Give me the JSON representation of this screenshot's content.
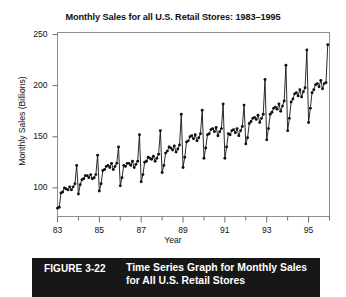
{
  "figure": {
    "caption_label": "FIGURE 3-22",
    "caption_line1": "Time Series Graph for Monthly Sales",
    "caption_line2": "for All U.S. Retail Stores",
    "caption_bar_color": "#171717",
    "caption_text_color": "#ffffff"
  },
  "chart_data": {
    "type": "line",
    "title": "Monthly Sales for all U.S. Retail Stores: 1983–1995",
    "xlabel": "Year",
    "ylabel": "Monthly Sales (Billions)",
    "xlim": [
      1983.0,
      1996.0
    ],
    "ylim": [
      72,
      252
    ],
    "yticks": [
      100,
      150,
      200,
      250
    ],
    "ytick_labels": [
      "100",
      "150",
      "200",
      "250"
    ],
    "xticks_major": [
      1983,
      1985,
      1987,
      1989,
      1991,
      1993,
      1995
    ],
    "xtick_labels": [
      "83",
      "85",
      "87",
      "89",
      "91",
      "93",
      "95"
    ],
    "xticks_minor": [
      1984,
      1986,
      1988,
      1990,
      1992,
      1994,
      1996
    ],
    "grid": false,
    "legend": null,
    "marker": "filled-circle",
    "line_color": "#111111",
    "series": [
      {
        "name": "Monthly Retail Sales (Billions)",
        "x_start": 1983.0,
        "x_step": 0.0833333,
        "values": [
          80,
          81,
          95,
          96,
          100,
          99,
          98,
          101,
          98,
          101,
          104,
          122,
          94,
          103,
          108,
          109,
          112,
          112,
          110,
          113,
          109,
          110,
          113,
          132,
          97,
          104,
          117,
          118,
          121,
          122,
          120,
          124,
          118,
          121,
          124,
          140,
          102,
          110,
          122,
          121,
          124,
          124,
          122,
          126,
          120,
          123,
          126,
          152,
          106,
          113,
          125,
          126,
          130,
          129,
          128,
          131,
          126,
          129,
          133,
          156,
          115,
          122,
          134,
          136,
          140,
          139,
          137,
          141,
          135,
          138,
          142,
          172,
          120,
          130,
          145,
          146,
          150,
          151,
          148,
          152,
          146,
          149,
          153,
          176,
          129,
          139,
          152,
          153,
          157,
          158,
          155,
          159,
          151,
          155,
          158,
          182,
          129,
          140,
          153,
          152,
          156,
          157,
          154,
          158,
          151,
          156,
          160,
          181,
          143,
          149,
          163,
          165,
          168,
          169,
          167,
          171,
          164,
          168,
          172,
          206,
          147,
          158,
          172,
          174,
          178,
          179,
          177,
          182,
          175,
          180,
          185,
          220,
          156,
          168,
          184,
          187,
          192,
          193,
          190,
          196,
          189,
          194,
          198,
          235,
          164,
          178,
          193,
          196,
          201,
          202,
          199,
          205,
          197,
          202,
          203,
          240
        ]
      }
    ]
  }
}
